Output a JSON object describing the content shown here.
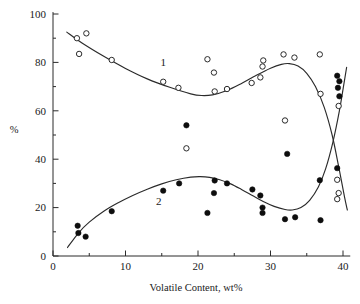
{
  "chart_data": {
    "type": "scatter",
    "title": "",
    "xlabel": "Volatile Content, wt%",
    "ylabel": "%",
    "xlim": [
      0,
      41
    ],
    "ylim": [
      0,
      100
    ],
    "xticks": [
      0,
      10,
      20,
      30,
      40
    ],
    "xtick_labels": [
      "0",
      "10",
      "20",
      "30",
      "40"
    ],
    "xminor_ticks": [
      5,
      15,
      25,
      35
    ],
    "yticks": [
      0,
      20,
      40,
      60,
      80,
      100
    ],
    "ytick_labels": [
      "0",
      "20",
      "40",
      "60",
      "80",
      "100"
    ],
    "yminor_ticks": [
      10,
      30,
      50,
      70,
      90
    ],
    "grid": false,
    "legend_position": "inline-curve-labels",
    "annotations": [
      {
        "text": "1",
        "x": 15.2,
        "y": 78.5,
        "name": "curve-1-label"
      },
      {
        "text": "2",
        "x": 14.6,
        "y": 21.0,
        "name": "curve-2-label"
      }
    ],
    "series": [
      {
        "name": "1",
        "marker": "open-circle",
        "marker_color": "#ffffff",
        "marker_edge_color": "#202020",
        "points": [
          {
            "x": 3.3,
            "y": 90.0
          },
          {
            "x": 3.6,
            "y": 83.5
          },
          {
            "x": 4.6,
            "y": 92.0
          },
          {
            "x": 8.1,
            "y": 81.0
          },
          {
            "x": 15.2,
            "y": 72.0
          },
          {
            "x": 17.3,
            "y": 69.5
          },
          {
            "x": 18.4,
            "y": 44.5
          },
          {
            "x": 21.3,
            "y": 81.3
          },
          {
            "x": 22.2,
            "y": 75.8
          },
          {
            "x": 22.3,
            "y": 68.0
          },
          {
            "x": 24.0,
            "y": 69.0
          },
          {
            "x": 27.4,
            "y": 71.5
          },
          {
            "x": 28.6,
            "y": 73.8
          },
          {
            "x": 29.0,
            "y": 80.8
          },
          {
            "x": 28.9,
            "y": 78.3
          },
          {
            "x": 31.8,
            "y": 83.3
          },
          {
            "x": 33.3,
            "y": 82.0
          },
          {
            "x": 32.0,
            "y": 56.0
          },
          {
            "x": 36.8,
            "y": 83.3
          },
          {
            "x": 36.9,
            "y": 67.0
          },
          {
            "x": 39.4,
            "y": 62.0
          },
          {
            "x": 39.2,
            "y": 31.5
          },
          {
            "x": 39.4,
            "y": 26.0
          },
          {
            "x": 39.2,
            "y": 23.5
          }
        ]
      },
      {
        "name": "2",
        "marker": "filled-circle",
        "marker_color": "#0d0d0d",
        "marker_edge_color": "#0d0d0d",
        "points": [
          {
            "x": 3.4,
            "y": 12.5
          },
          {
            "x": 3.5,
            "y": 9.5
          },
          {
            "x": 4.5,
            "y": 8.0
          },
          {
            "x": 8.1,
            "y": 18.5
          },
          {
            "x": 15.2,
            "y": 27.0
          },
          {
            "x": 17.4,
            "y": 30.0
          },
          {
            "x": 18.4,
            "y": 54.0
          },
          {
            "x": 21.3,
            "y": 17.8
          },
          {
            "x": 22.2,
            "y": 26.0
          },
          {
            "x": 22.3,
            "y": 31.2
          },
          {
            "x": 24.0,
            "y": 30.0
          },
          {
            "x": 27.5,
            "y": 27.5
          },
          {
            "x": 28.6,
            "y": 25.0
          },
          {
            "x": 28.9,
            "y": 20.0
          },
          {
            "x": 28.9,
            "y": 17.8
          },
          {
            "x": 32.0,
            "y": 15.2
          },
          {
            "x": 32.3,
            "y": 42.2
          },
          {
            "x": 33.4,
            "y": 16.0
          },
          {
            "x": 36.8,
            "y": 31.3
          },
          {
            "x": 36.9,
            "y": 14.8
          },
          {
            "x": 39.2,
            "y": 74.5
          },
          {
            "x": 39.5,
            "y": 72.2
          },
          {
            "x": 39.3,
            "y": 69.5
          },
          {
            "x": 39.5,
            "y": 66.0
          },
          {
            "x": 39.2,
            "y": 36.3
          }
        ]
      }
    ],
    "fit_curves": [
      {
        "name": "curve-1",
        "for_series": "1",
        "description": "descending then rising then falling trend through open circles",
        "path_points": [
          {
            "x": 1.9,
            "y": 92.5
          },
          {
            "x": 4.0,
            "y": 88.0
          },
          {
            "x": 7.0,
            "y": 82.5
          },
          {
            "x": 10.0,
            "y": 77.5
          },
          {
            "x": 13.0,
            "y": 73.2
          },
          {
            "x": 16.0,
            "y": 69.8
          },
          {
            "x": 19.0,
            "y": 67.0
          },
          {
            "x": 20.5,
            "y": 66.3
          },
          {
            "x": 22.0,
            "y": 66.6
          },
          {
            "x": 24.0,
            "y": 68.4
          },
          {
            "x": 26.0,
            "y": 71.3
          },
          {
            "x": 28.0,
            "y": 74.6
          },
          {
            "x": 30.0,
            "y": 77.6
          },
          {
            "x": 31.5,
            "y": 79.2
          },
          {
            "x": 32.6,
            "y": 79.5
          },
          {
            "x": 33.8,
            "y": 78.5
          },
          {
            "x": 35.0,
            "y": 75.5
          },
          {
            "x": 36.2,
            "y": 70.0
          },
          {
            "x": 37.4,
            "y": 61.5
          },
          {
            "x": 38.5,
            "y": 50.0
          },
          {
            "x": 39.4,
            "y": 37.0
          },
          {
            "x": 40.2,
            "y": 24.5
          },
          {
            "x": 40.6,
            "y": 19.0
          }
        ]
      },
      {
        "name": "curve-2",
        "for_series": "2",
        "description": "rising then falling then rising trend through filled circles",
        "path_points": [
          {
            "x": 2.0,
            "y": 3.5
          },
          {
            "x": 3.5,
            "y": 9.5
          },
          {
            "x": 5.0,
            "y": 14.0
          },
          {
            "x": 7.0,
            "y": 18.5
          },
          {
            "x": 9.0,
            "y": 22.0
          },
          {
            "x": 11.0,
            "y": 25.0
          },
          {
            "x": 13.0,
            "y": 27.6
          },
          {
            "x": 15.0,
            "y": 29.8
          },
          {
            "x": 17.0,
            "y": 31.5
          },
          {
            "x": 19.0,
            "y": 32.6
          },
          {
            "x": 20.3,
            "y": 32.8
          },
          {
            "x": 21.6,
            "y": 32.5
          },
          {
            "x": 23.0,
            "y": 31.5
          },
          {
            "x": 24.5,
            "y": 29.8
          },
          {
            "x": 26.0,
            "y": 27.5
          },
          {
            "x": 27.5,
            "y": 25.0
          },
          {
            "x": 29.0,
            "y": 22.5
          },
          {
            "x": 30.5,
            "y": 20.5
          },
          {
            "x": 32.0,
            "y": 19.2
          },
          {
            "x": 33.0,
            "y": 19.0
          },
          {
            "x": 34.2,
            "y": 20.0
          },
          {
            "x": 35.4,
            "y": 23.0
          },
          {
            "x": 36.6,
            "y": 28.5
          },
          {
            "x": 37.6,
            "y": 36.0
          },
          {
            "x": 38.6,
            "y": 47.0
          },
          {
            "x": 39.5,
            "y": 60.0
          },
          {
            "x": 40.2,
            "y": 72.5
          },
          {
            "x": 40.5,
            "y": 78.0
          }
        ]
      }
    ]
  }
}
